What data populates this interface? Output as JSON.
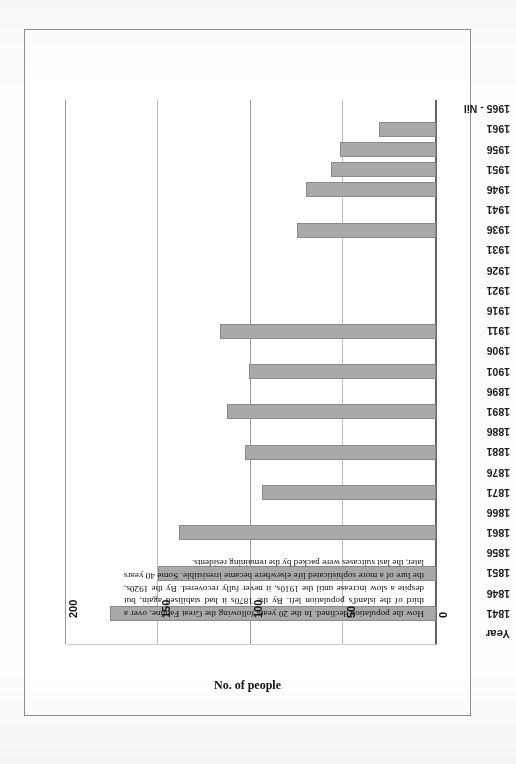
{
  "figure": {
    "caption": "How the population declined. In the 20 years following the Great Famine, over a third of the island's population left. By the 1870s it had stabilised again, but despite a slow increase until the 1910s, it never fully recovered. By the 1920s, the lure of a more sophisticated life elsewhere became irresistible. Some 40 years later, the last suitcases were packed by the remaining residents.",
    "orientation_note": "chart-printed-upside-down",
    "bar_color": "#a9a9a9",
    "bar_border_color": "#8a8a8a",
    "gridline_color": "#bdbdbd",
    "axis_color": "#5a5a5a"
  },
  "chart_data": {
    "type": "bar",
    "orientation": "horizontal",
    "title": "",
    "xlabel": "No. of people",
    "ylabel": "Year",
    "xlim": [
      0,
      200
    ],
    "xticks": [
      0,
      50,
      100,
      150,
      200
    ],
    "xtick_labels": [
      "0",
      "50",
      "100",
      "150",
      "200"
    ],
    "grid": true,
    "legend": null,
    "categories": [
      "Year",
      "1841",
      "1846",
      "1851",
      "1856",
      "1861",
      "1866",
      "1871",
      "1876",
      "1881",
      "1886",
      "1891",
      "1896",
      "1901",
      "1906",
      "1911",
      "1916",
      "1921",
      "1926",
      "1931",
      "1936",
      "1941",
      "1946",
      "1951",
      "1956",
      "1961",
      "1965 - Nil"
    ],
    "values": [
      null,
      176,
      null,
      150,
      null,
      139,
      null,
      94,
      null,
      103,
      null,
      113,
      null,
      101,
      null,
      117,
      null,
      null,
      null,
      null,
      75,
      null,
      70,
      57,
      52,
      31,
      0
    ]
  }
}
